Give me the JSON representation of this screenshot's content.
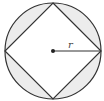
{
  "diagram": {
    "title": "",
    "shapes": {
      "circle": {
        "cx": 53,
        "cy": 51,
        "r": 48,
        "stroke": "#333333",
        "segment_fill": "#ececec"
      },
      "inscribed_square": {
        "points": [
          [
            53,
            3
          ],
          [
            101,
            51
          ],
          [
            53,
            99
          ],
          [
            5,
            51
          ]
        ],
        "fill": "#ffffff",
        "stroke": "#333333"
      },
      "center_point": {
        "cx": 53,
        "cy": 51,
        "r": 2,
        "fill": "#222222"
      },
      "radius_line": {
        "x1": 53,
        "y1": 51,
        "x2": 101,
        "y2": 51,
        "stroke": "#333333"
      }
    },
    "labels": {
      "radius": "r"
    }
  }
}
